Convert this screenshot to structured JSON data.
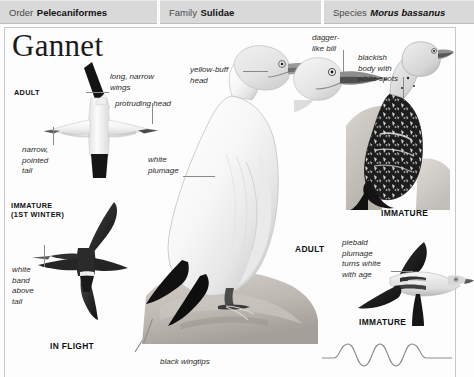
{
  "page": {
    "title": "Gannet",
    "background": "#fdfdfd",
    "rule_color": "#c8c8c8"
  },
  "taxonomy": [
    {
      "label": "Order",
      "value": "Pelecaniformes",
      "italic": false
    },
    {
      "label": "Family",
      "value": "Sulidae",
      "italic": false
    },
    {
      "label": "Species",
      "value": "Morus bassanus",
      "italic": true
    }
  ],
  "annotations": [
    {
      "id": "long-narrow-wings",
      "text": "long, narrow\nwings"
    },
    {
      "id": "protruding-head",
      "text": "protruding head"
    },
    {
      "id": "narrow-pointed-tail",
      "text": "narrow,\npointed\ntail"
    },
    {
      "id": "white-band-above-tail",
      "text": "white\nband\nabove\ntail"
    },
    {
      "id": "yellow-buff-head",
      "text": "yellow-buff\nhead"
    },
    {
      "id": "white-plumage",
      "text": "white\nplumage"
    },
    {
      "id": "dagger-like-bill",
      "text": "dagger-\nlike bill"
    },
    {
      "id": "blackish-body-white-spots",
      "text": "blackish\nbody with\nwhite spots"
    },
    {
      "id": "piebald-plumage",
      "text": "piebald\nplumage\nturns white\nwith age"
    },
    {
      "id": "black-wingtips",
      "text": "black wingtips"
    }
  ],
  "captions": [
    {
      "id": "adult-flight",
      "text": "ADULT"
    },
    {
      "id": "immature-first-winter",
      "text": "IMMATURE\n(1ST WINTER)"
    },
    {
      "id": "in-flight",
      "text": "IN FLIGHT"
    },
    {
      "id": "adult-perched",
      "text": "ADULT"
    },
    {
      "id": "immature-perched",
      "text": "IMMATURE"
    },
    {
      "id": "immature-flying",
      "text": "IMMATURE"
    }
  ],
  "figures": [
    {
      "id": "adult-in-flight-underside",
      "subject": "adult gannet in flight seen from below"
    },
    {
      "id": "immature-in-flight",
      "subject": "immature gannet in flight, dark with white band"
    },
    {
      "id": "adult-perched-on-rock",
      "subject": "adult gannet standing on rock"
    },
    {
      "id": "adult-head-profile",
      "subject": "adult gannet head in profile"
    },
    {
      "id": "immature-perched-on-rock",
      "subject": "immature gannet standing on rock"
    },
    {
      "id": "immature-in-flight-side",
      "subject": "immature gannet flying, piebald plumage"
    },
    {
      "id": "flight-pattern-wave",
      "subject": "undulating flight path diagram"
    }
  ]
}
